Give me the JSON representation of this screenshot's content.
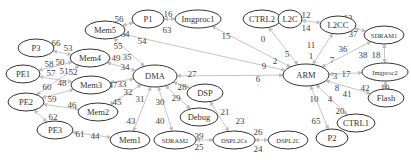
{
  "diagram": {
    "type": "directed-graph",
    "nodes": [
      {
        "id": "Mem5",
        "label": "Mem5",
        "x": 105,
        "y": 30,
        "rx": 20,
        "ry": 9
      },
      {
        "id": "P1",
        "label": "P1",
        "x": 148,
        "y": 19,
        "rx": 16,
        "ry": 9
      },
      {
        "id": "Imgproc1",
        "label": "Imgproc1",
        "x": 198,
        "y": 19,
        "rx": 23,
        "ry": 9
      },
      {
        "id": "CTRL2",
        "label": "CTRL2",
        "x": 262,
        "y": 19,
        "rx": 19,
        "ry": 9
      },
      {
        "id": "L2C",
        "label": "L2C",
        "x": 290,
        "y": 19,
        "rx": 12,
        "ry": 9
      },
      {
        "id": "L2CC",
        "label": "L2CC",
        "x": 338,
        "y": 25,
        "rx": 18,
        "ry": 9
      },
      {
        "id": "SDRAM1",
        "label": "SDRAM1",
        "x": 384,
        "y": 35,
        "rx": 20,
        "ry": 9,
        "small": true
      },
      {
        "id": "Imgproc2",
        "label": "Imgproc2",
        "x": 385,
        "y": 72,
        "rx": 23,
        "ry": 9,
        "small": true
      },
      {
        "id": "Flash",
        "label": "Flash",
        "x": 386,
        "y": 98,
        "rx": 18,
        "ry": 9
      },
      {
        "id": "CTRL1",
        "label": "CTRL1",
        "x": 356,
        "y": 123,
        "rx": 19,
        "ry": 9
      },
      {
        "id": "P2",
        "label": "P2",
        "x": 332,
        "y": 138,
        "rx": 16,
        "ry": 9
      },
      {
        "id": "ARM",
        "label": "ARM",
        "x": 306,
        "y": 75,
        "rx": 23,
        "ry": 11
      },
      {
        "id": "P3",
        "label": "P3",
        "x": 36,
        "y": 48,
        "rx": 18,
        "ry": 9
      },
      {
        "id": "PE1",
        "label": "PE1",
        "x": 23,
        "y": 74,
        "rx": 17,
        "ry": 9
      },
      {
        "id": "PE2",
        "label": "PE2",
        "x": 26,
        "y": 102,
        "rx": 18,
        "ry": 9
      },
      {
        "id": "PE3",
        "label": "PE3",
        "x": 55,
        "y": 130,
        "rx": 18,
        "ry": 9
      },
      {
        "id": "Mem4",
        "label": "Mem4",
        "x": 90,
        "y": 58,
        "rx": 20,
        "ry": 9
      },
      {
        "id": "Mem3",
        "label": "Mem3",
        "x": 91,
        "y": 85,
        "rx": 20,
        "ry": 9
      },
      {
        "id": "Mem2",
        "label": "Mem2",
        "x": 98,
        "y": 112,
        "rx": 20,
        "ry": 9
      },
      {
        "id": "Mem1",
        "label": "Mem1",
        "x": 130,
        "y": 140,
        "rx": 20,
        "ry": 9
      },
      {
        "id": "DMA",
        "label": "DMA",
        "x": 155,
        "y": 76,
        "rx": 22,
        "ry": 11
      },
      {
        "id": "DSP",
        "label": "DSP",
        "x": 205,
        "y": 93,
        "rx": 18,
        "ry": 9
      },
      {
        "id": "Debug",
        "label": "Debug",
        "x": 199,
        "y": 117,
        "rx": 19,
        "ry": 9
      },
      {
        "id": "SDRAM2",
        "label": "SDRAM2",
        "x": 175,
        "y": 140,
        "rx": 21,
        "ry": 9,
        "small": true
      },
      {
        "id": "DSPL2Cs",
        "label": "DSPL2Cs",
        "x": 234,
        "y": 140,
        "rx": 21,
        "ry": 9,
        "small": true
      },
      {
        "id": "DSPL2C",
        "label": "DSPL2C",
        "x": 288,
        "y": 140,
        "rx": 20,
        "ry": 9,
        "small": true
      }
    ],
    "edges": [
      {
        "from": "Mem5",
        "to": "P1",
        "labels": [
          {
            "t": "56",
            "x": 119,
            "y": 22
          },
          {
            "t": "64",
            "x": 125,
            "y": 37
          }
        ]
      },
      {
        "from": "P1",
        "to": "Imgproc1",
        "labels": [
          {
            "t": "16",
            "x": 168,
            "y": 17
          },
          {
            "t": "63",
            "x": 167,
            "y": 33
          }
        ]
      },
      {
        "from": "Imgproc1",
        "to": "ARM",
        "labels": [
          {
            "t": "15",
            "x": 226,
            "y": 39
          }
        ]
      },
      {
        "from": "CTRL2",
        "to": "ARM",
        "labels": [
          {
            "t": "0",
            "x": 263,
            "y": 42
          }
        ]
      },
      {
        "from": "L2C",
        "to": "L2CC",
        "labels": [
          {
            "t": "12",
            "x": 306,
            "y": 18
          },
          {
            "t": "14",
            "x": 306,
            "y": 31
          }
        ]
      },
      {
        "from": "L2CC",
        "to": "ARM",
        "labels": [
          {
            "t": "11",
            "x": 311,
            "y": 48
          },
          {
            "t": "1",
            "x": 311,
            "y": 59
          }
        ]
      },
      {
        "from": "L2CC",
        "to": "SDRAM1",
        "labels": [
          {
            "t": "13",
            "x": 348,
            "y": 21
          },
          {
            "t": "37",
            "x": 353,
            "y": 37
          }
        ]
      },
      {
        "from": "SDRAM1",
        "to": "ARM",
        "labels": [
          {
            "t": "36",
            "x": 343,
            "y": 52
          },
          {
            "t": "7",
            "x": 332,
            "y": 63
          }
        ]
      },
      {
        "from": "SDRAM1",
        "to": "Imgproc2",
        "labels": [
          {
            "t": "38",
            "x": 363,
            "y": 58
          },
          {
            "t": "18",
            "x": 376,
            "y": 58
          }
        ]
      },
      {
        "from": "ARM",
        "to": "Imgproc2",
        "labels": [
          {
            "t": "3",
            "x": 335,
            "y": 79
          },
          {
            "t": "17",
            "x": 346,
            "y": 77
          }
        ]
      },
      {
        "from": "Imgproc2",
        "to": "Flash",
        "labels": [
          {
            "t": "42",
            "x": 365,
            "y": 91
          },
          {
            "t": "19",
            "x": 385,
            "y": 91
          }
        ]
      },
      {
        "from": "ARM",
        "to": "Flash",
        "labels": [
          {
            "t": "8",
            "x": 337,
            "y": 91
          },
          {
            "t": "41",
            "x": 347,
            "y": 97
          }
        ]
      },
      {
        "from": "ARM",
        "to": "CTRL1",
        "labels": [
          {
            "t": "4",
            "x": 330,
            "y": 102
          },
          {
            "t": "20",
            "x": 340,
            "y": 114
          }
        ]
      },
      {
        "from": "ARM",
        "to": "P2",
        "labels": [
          {
            "t": "10",
            "x": 314,
            "y": 102
          },
          {
            "t": "65",
            "x": 316,
            "y": 124
          }
        ]
      },
      {
        "from": "Mem5",
        "to": "ARM",
        "labels": [
          {
            "t": "54",
            "x": 142,
            "y": 44
          }
        ]
      },
      {
        "from": "ARM",
        "to": "DMA",
        "labels": [
          {
            "t": "5",
            "x": 287,
            "y": 57
          },
          {
            "t": "2",
            "x": 275,
            "y": 64
          },
          {
            "t": "9",
            "x": 264,
            "y": 69
          },
          {
            "t": "6",
            "x": 258,
            "y": 82
          },
          {
            "t": "27",
            "x": 192,
            "y": 77
          }
        ]
      },
      {
        "from": "Mem5",
        "to": "DMA",
        "labels": [
          {
            "t": "55",
            "x": 118,
            "y": 49
          },
          {
            "t": "35",
            "x": 127,
            "y": 60
          }
        ]
      },
      {
        "from": "P3",
        "to": "Mem4",
        "labels": [
          {
            "t": "66",
            "x": 56,
            "y": 46
          },
          {
            "t": "53",
            "x": 68,
            "y": 51
          }
        ]
      },
      {
        "from": "PE1",
        "to": "Mem4",
        "labels": [
          {
            "t": "58",
            "x": 49,
            "y": 67
          },
          {
            "t": "50",
            "x": 60,
            "y": 65
          }
        ]
      },
      {
        "from": "PE1",
        "to": "Mem3",
        "labels": [
          {
            "t": "57",
            "x": 51,
            "y": 76
          },
          {
            "t": "51",
            "x": 64,
            "y": 74
          }
        ]
      },
      {
        "from": "PE2",
        "to": "Mem4",
        "labels": [
          {
            "t": "52",
            "x": 73,
            "y": 75
          }
        ]
      },
      {
        "from": "PE2",
        "to": "Mem3",
        "labels": [
          {
            "t": "60",
            "x": 47,
            "y": 90
          },
          {
            "t": "48",
            "x": 62,
            "y": 86
          }
        ]
      },
      {
        "from": "PE2",
        "to": "Mem2",
        "labels": [
          {
            "t": "59",
            "x": 52,
            "y": 102
          },
          {
            "t": "46",
            "x": 72,
            "y": 108
          }
        ]
      },
      {
        "from": "PE2",
        "to": "PE3",
        "labels": [
          {
            "t": "62",
            "x": 53,
            "y": 120
          }
        ]
      },
      {
        "from": "PE3",
        "to": "Mem1",
        "labels": [
          {
            "t": "61",
            "x": 80,
            "y": 137
          },
          {
            "t": "44",
            "x": 95,
            "y": 139
          }
        ]
      },
      {
        "from": "Mem4",
        "to": "DMA",
        "labels": [
          {
            "t": "49",
            "x": 116,
            "y": 61
          },
          {
            "t": "34",
            "x": 125,
            "y": 70
          }
        ]
      },
      {
        "from": "Mem3",
        "to": "DMA",
        "labels": [
          {
            "t": "47",
            "x": 113,
            "y": 88
          },
          {
            "t": "33",
            "x": 122,
            "y": 87
          }
        ]
      },
      {
        "from": "Mem2",
        "to": "DMA",
        "labels": [
          {
            "t": "45",
            "x": 117,
            "y": 105
          },
          {
            "t": "32",
            "x": 128,
            "y": 95
          }
        ]
      },
      {
        "from": "Mem1",
        "to": "DMA",
        "labels": [
          {
            "t": "43",
            "x": 131,
            "y": 124
          },
          {
            "t": "31",
            "x": 140,
            "y": 102
          }
        ]
      },
      {
        "from": "SDRAM2",
        "to": "DMA",
        "labels": [
          {
            "t": "40",
            "x": 160,
            "y": 124
          },
          {
            "t": "30",
            "x": 160,
            "y": 105
          }
        ]
      },
      {
        "from": "DMA",
        "to": "Debug",
        "labels": [
          {
            "t": "29",
            "x": 176,
            "y": 101
          }
        ]
      },
      {
        "from": "DMA",
        "to": "DSP",
        "labels": [
          {
            "t": "28",
            "x": 182,
            "y": 90
          },
          {
            "t": "22",
            "x": 200,
            "y": 94
          }
        ]
      },
      {
        "from": "DSP",
        "to": "DSPL2Cs",
        "labels": [
          {
            "t": "21",
            "x": 225,
            "y": 115
          },
          {
            "t": "23",
            "x": 240,
            "y": 124
          }
        ]
      },
      {
        "from": "SDRAM2",
        "to": "DSPL2Cs",
        "labels": [
          {
            "t": "39",
            "x": 199,
            "y": 139
          },
          {
            "t": "25",
            "x": 199,
            "y": 150
          }
        ]
      },
      {
        "from": "DSPL2Cs",
        "to": "DSPL2C",
        "labels": [
          {
            "t": "26",
            "x": 258,
            "y": 135
          },
          {
            "t": "24",
            "x": 258,
            "y": 152
          }
        ]
      }
    ]
  }
}
